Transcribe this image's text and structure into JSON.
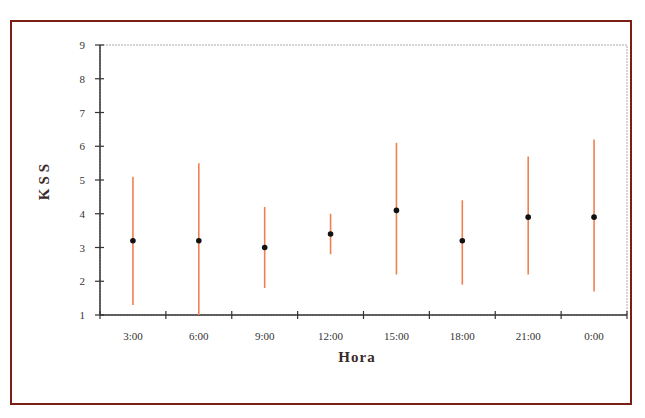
{
  "chart_data": {
    "type": "scatter",
    "subtype": "error-bar",
    "title": "",
    "xlabel": "Hora",
    "ylabel": "KSS",
    "categories": [
      "3:00",
      "6:00",
      "9:00",
      "12:00",
      "15:00",
      "18:00",
      "21:00",
      "0:00"
    ],
    "series": [
      {
        "name": "KSS",
        "values": [
          3.2,
          3.2,
          3.0,
          3.4,
          4.1,
          3.2,
          3.9,
          3.9
        ],
        "upper": [
          5.1,
          5.5,
          4.2,
          4.0,
          6.1,
          4.4,
          5.7,
          6.2
        ],
        "lower": [
          1.3,
          1.0,
          1.8,
          2.8,
          2.2,
          1.9,
          2.2,
          1.7
        ]
      }
    ],
    "ylim": [
      1,
      9
    ],
    "yticks": [
      1,
      2,
      3,
      4,
      5,
      6,
      7,
      8,
      9
    ],
    "grid": false,
    "legend": "none",
    "colors": {
      "errorbar": "#f08050",
      "point": "#111111",
      "frame": "#7a1f16",
      "axis": "#333333"
    }
  }
}
